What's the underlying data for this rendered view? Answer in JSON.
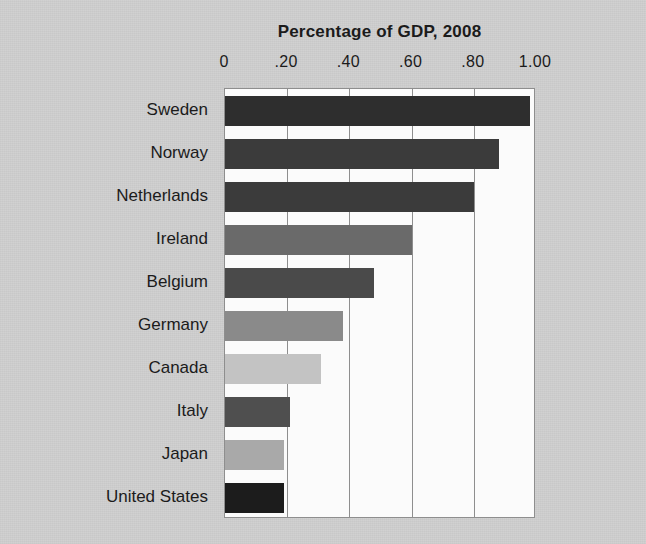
{
  "figure": {
    "background_color": "#cfcfcf",
    "plot_background_color": "#fbfbfb",
    "axis_color": "#8e8e8e"
  },
  "chart_data": {
    "type": "bar",
    "orientation": "horizontal",
    "title": "Percentage of GDP, 2008",
    "subtitle": "",
    "xlabel": "",
    "ylabel": "",
    "xlim": [
      0,
      1.0
    ],
    "grid": true,
    "grid_axis": "x",
    "legend": false,
    "legend_position": "none",
    "xaxis_position": "top",
    "categories": [
      "Sweden",
      "Norway",
      "Netherlands",
      "Ireland",
      "Belgium",
      "Germany",
      "Canada",
      "Italy",
      "Japan",
      "United States"
    ],
    "values": [
      0.98,
      0.88,
      0.8,
      0.6,
      0.48,
      0.38,
      0.31,
      0.21,
      0.19,
      0.19
    ],
    "bar_colors": [
      "#2e2e2e",
      "#3b3b3b",
      "#3b3b3b",
      "#6a6a6a",
      "#4a4a4a",
      "#8a8a8a",
      "#c3c3c3",
      "#4f4f4f",
      "#a9a9a9",
      "#1c1c1c"
    ],
    "xticks": [
      0,
      0.2,
      0.4,
      0.6,
      0.8,
      1.0
    ],
    "xticklabels": [
      "0",
      ".20",
      ".40",
      ".60",
      ".80",
      "1.00"
    ]
  }
}
